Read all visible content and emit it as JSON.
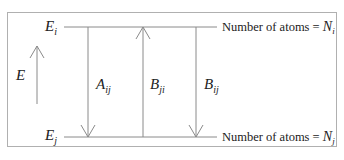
{
  "diagram": {
    "upper_level": {
      "symbol": "E",
      "subscript": "i",
      "population_label": "Number of atoms = ",
      "population_symbol": "N",
      "population_subscript": "i"
    },
    "lower_level": {
      "symbol": "E",
      "subscript": "j",
      "population_label": "Number of atoms = ",
      "population_symbol": "N",
      "population_subscript": "j"
    },
    "energy_axis": {
      "symbol": "E",
      "direction": "up"
    },
    "transitions": [
      {
        "symbol": "A",
        "subscript": "ij",
        "direction": "down",
        "meaning": "spontaneous emission"
      },
      {
        "symbol": "B",
        "subscript": "ji",
        "direction": "up",
        "meaning": "absorption"
      },
      {
        "symbol": "B",
        "subscript": "ij",
        "direction": "down",
        "meaning": "stimulated emission"
      }
    ],
    "colors": {
      "line": "#8a8a8a",
      "text": "#222222",
      "frame": "#b0b0b0"
    }
  }
}
